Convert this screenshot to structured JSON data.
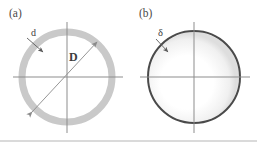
{
  "figure": {
    "background_color": "#ffffff",
    "width": 257,
    "height": 142,
    "bottom_rule_color": "#b5b5b5"
  },
  "panels": [
    {
      "id": "a",
      "label": "(a)",
      "label_x": 9,
      "label_y": 17,
      "description": "Thick light-gray annulus with horizontal and vertical axes, wall thickness callout d and diameter arrow D",
      "ring": {
        "center_x": 67,
        "center_y": 77,
        "radius": 45,
        "thickness": 7,
        "color": "#c9c9c9",
        "fill": "#ffffff"
      },
      "axes": {
        "color": "#8d8d8d",
        "width": 1,
        "horizontal": {
          "x1": 13,
          "y1": 77,
          "x2": 123,
          "y2": 77
        },
        "vertical": {
          "x1": 67,
          "y1": 22,
          "x2": 67,
          "y2": 133
        }
      },
      "annotations": [
        {
          "name": "thickness-callout",
          "text": "d",
          "text_x": 31,
          "text_y": 36,
          "style": "small",
          "arrow": {
            "x1": 27,
            "y1": 38,
            "x2": 43,
            "y2": 52
          },
          "color": "#5a5a5a"
        },
        {
          "name": "diameter-arrow",
          "text": "D",
          "text_x": 69,
          "text_y": 61,
          "style": "big",
          "arrow": {
            "x1": 32,
            "y1": 112,
            "x2": 97,
            "y2": 42
          },
          "color": "#8a8a8a"
        }
      ]
    },
    {
      "id": "b",
      "label": "(b)",
      "label_x": 139,
      "label_y": 17,
      "description": "Thin dark circle outline with a faint gray inner shading and crossed axes, wall thickness callout delta",
      "ring": {
        "center_x": 194,
        "center_y": 77,
        "radius": 46,
        "thickness": 2,
        "color": "#4a4a4a",
        "fill": "#ffffff",
        "inner_shade_color": "#e2e2e2"
      },
      "axes": {
        "color": "#8d8d8d",
        "width": 1,
        "horizontal": {
          "x1": 140,
          "y1": 77,
          "x2": 250,
          "y2": 77
        },
        "vertical": {
          "x1": 194,
          "y1": 22,
          "x2": 194,
          "y2": 133
        }
      },
      "annotations": [
        {
          "name": "thickness-callout",
          "text": "δ",
          "text_x": 158,
          "text_y": 36,
          "style": "greek",
          "arrow": {
            "x1": 156,
            "y1": 39,
            "x2": 168,
            "y2": 52
          },
          "color": "#5a5a5a"
        }
      ]
    }
  ],
  "legend_notes": {
    "d": "Wall thickness of the thick-walled ring in panel (a)",
    "D": "Diameter of the ring in panel (a)",
    "delta": "Wall thickness of the thin-walled shell in panel (b)"
  }
}
